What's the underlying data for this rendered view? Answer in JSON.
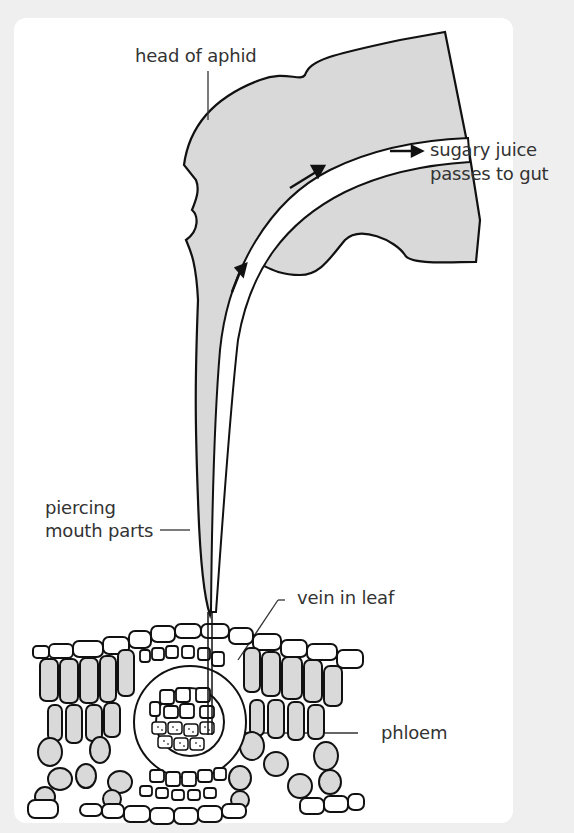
{
  "figure": {
    "type": "biology diagram",
    "colors": {
      "background": "#efefef",
      "card": "#ffffff",
      "fill_grey": "#d9d9d9",
      "stroke": "#111111",
      "text": "#333333"
    },
    "labels": {
      "head": "head of aphid",
      "juice_line1": "sugary juice",
      "juice_line2": "passes to gut",
      "mouth_line1": "piercing",
      "mouth_line2": "mouth parts",
      "vein": "vein in leaf",
      "phloem": "phloem"
    }
  }
}
